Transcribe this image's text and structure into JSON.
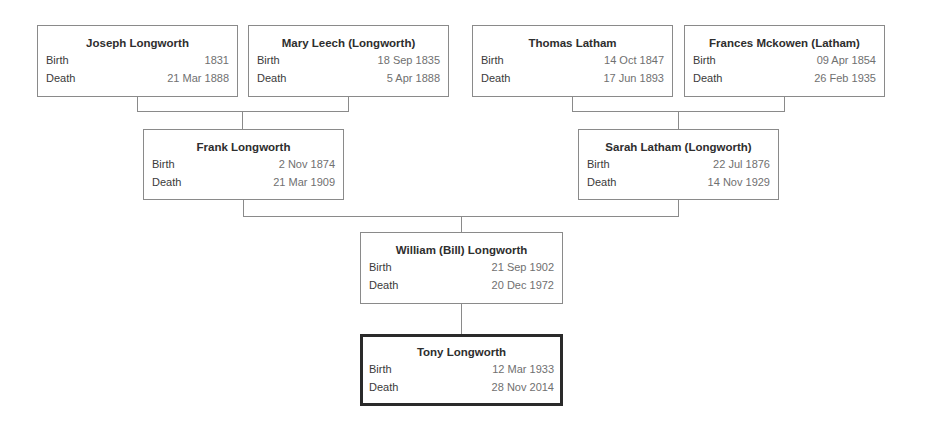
{
  "labels": {
    "birth": "Birth",
    "death": "Death"
  },
  "people": {
    "joseph": {
      "name": "Joseph Longworth",
      "birth": "1831",
      "death": "21 Mar 1888"
    },
    "mary": {
      "name": "Mary Leech (Longworth)",
      "birth": "18 Sep 1835",
      "death": "5 Apr 1888"
    },
    "thomas": {
      "name": "Thomas Latham",
      "birth": "14 Oct 1847",
      "death": "17 Jun 1893"
    },
    "frances": {
      "name": "Frances Mckowen (Latham)",
      "birth": "09 Apr 1854",
      "death": "26 Feb 1935"
    },
    "frank": {
      "name": "Frank Longworth",
      "birth": "2 Nov 1874",
      "death": "21 Mar 1909"
    },
    "sarah": {
      "name": "Sarah Latham (Longworth)",
      "birth": "22 Jul 1876",
      "death": "14 Nov 1929"
    },
    "william": {
      "name": "William (Bill) Longworth",
      "birth": "21 Sep 1902",
      "death": "20 Dec 1972"
    },
    "tony": {
      "name": "Tony Longworth",
      "birth": "12 Mar 1933",
      "death": "28 Nov 2014"
    }
  },
  "colors": {
    "border": "#8a8a8a",
    "focus_border": "#2a2a2a",
    "label": "#3a3a3a",
    "value": "#707070"
  }
}
